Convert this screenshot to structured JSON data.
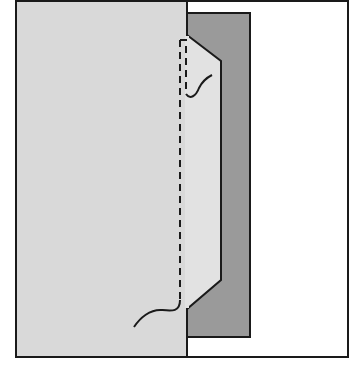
{
  "diagram": {
    "title": "",
    "colors": {
      "background": "#ffffff",
      "garment_light": "#d9d9d9",
      "facing_dark": "#9a9a9a",
      "facing_light": "#e2e2e2",
      "outline": "#1a1a1a"
    },
    "labels": []
  }
}
